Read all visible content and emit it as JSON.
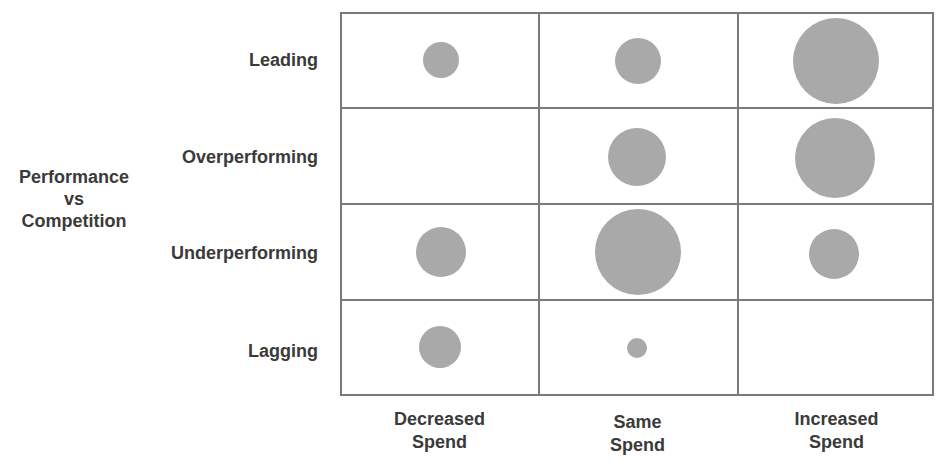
{
  "chart_data": {
    "type": "bubble-matrix",
    "title": "",
    "ylabel": "Performance vs Competition",
    "xlabel": "",
    "rows": [
      "Leading",
      "Overperforming",
      "Underperforming",
      "Lagging"
    ],
    "columns": [
      "Decreased Spend",
      "Same Spend",
      "Increased Spend"
    ],
    "bubble_color": "#a9a9a9",
    "grid_color": "#7a7a7a",
    "bubbles": [
      {
        "row": "Leading",
        "column": "Decreased Spend",
        "size": 36
      },
      {
        "row": "Leading",
        "column": "Same Spend",
        "size": 46
      },
      {
        "row": "Leading",
        "column": "Increased Spend",
        "size": 86
      },
      {
        "row": "Overperforming",
        "column": "Decreased Spend",
        "size": 0
      },
      {
        "row": "Overperforming",
        "column": "Same Spend",
        "size": 58
      },
      {
        "row": "Overperforming",
        "column": "Increased Spend",
        "size": 80
      },
      {
        "row": "Underperforming",
        "column": "Decreased Spend",
        "size": 50
      },
      {
        "row": "Underperforming",
        "column": "Same Spend",
        "size": 86
      },
      {
        "row": "Underperforming",
        "column": "Increased Spend",
        "size": 50
      },
      {
        "row": "Lagging",
        "column": "Decreased Spend",
        "size": 42
      },
      {
        "row": "Lagging",
        "column": "Same Spend",
        "size": 20
      },
      {
        "row": "Lagging",
        "column": "Increased Spend",
        "size": 0
      }
    ],
    "legend": "none",
    "grid": true
  },
  "labels": {
    "axis_title_line1": "Performance",
    "axis_title_line2": "vs",
    "axis_title_line3": "Competition",
    "rows": [
      "Leading",
      "Overperforming",
      "Underperforming",
      "Lagging"
    ],
    "columns": [
      {
        "line1": "Decreased",
        "line2": "Spend"
      },
      {
        "line1": "Same",
        "line2": "Spend"
      },
      {
        "line1": "Increased",
        "line2": "Spend"
      }
    ]
  }
}
